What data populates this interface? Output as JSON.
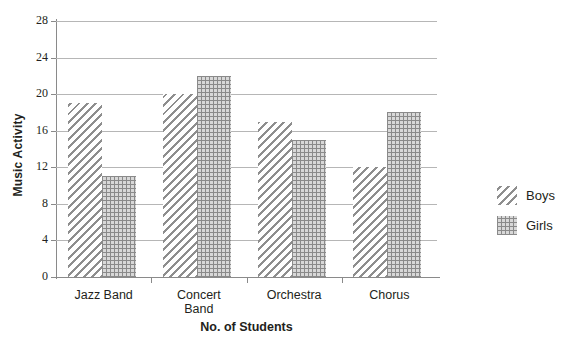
{
  "chart_data": {
    "type": "bar",
    "title": "",
    "subtitle": "",
    "xlabel": "No. of Students",
    "ylabel": "Music Activity",
    "categories": [
      "Jazz Band",
      "Concert Band",
      "Orchestra",
      "Chorus"
    ],
    "series": [
      {
        "name": "Boys",
        "values": [
          19,
          20,
          17,
          12
        ],
        "pattern": "diagonal-hatch",
        "color": "#8e8e8e"
      },
      {
        "name": "Girls",
        "values": [
          11,
          22,
          15,
          18
        ],
        "pattern": "dotted-grid",
        "color": "#8a8a8a"
      }
    ],
    "ylim": [
      0,
      28
    ],
    "yticks": [
      0,
      4,
      8,
      12,
      16,
      20,
      24,
      28
    ],
    "ytick_labels": [
      "0",
      "4",
      "8",
      "12",
      "16",
      "20",
      "24",
      "28"
    ],
    "grid": true,
    "grid_axis": "y",
    "legend_position": "right",
    "bar_group_order": [
      "Boys",
      "Girls"
    ],
    "background_color": "#ffffff",
    "gridline_color": "#b6b6b6",
    "axis_color": "#8a8a8a",
    "text_color": "#231f20"
  },
  "axes": {
    "y_title": "Music Activity",
    "x_title": "No. of Students"
  },
  "legend": {
    "items": [
      {
        "label": "Boys",
        "swatch": "diagonal-hatch-swatch"
      },
      {
        "label": "Girls",
        "swatch": "dotted-grid-swatch"
      }
    ]
  },
  "x_category_labels": [
    "Jazz Band",
    "Concert\nBand",
    "Orchestra",
    "Chorus"
  ]
}
